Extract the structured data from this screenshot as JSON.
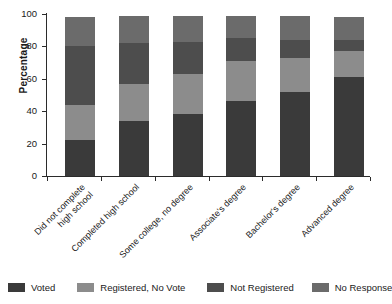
{
  "chart_data": {
    "type": "bar",
    "subtype": "stacked-bar-100",
    "title": "",
    "xlabel": "",
    "ylabel": "Percentage",
    "ylim": [
      0,
      100
    ],
    "yticks": [
      0,
      20,
      40,
      60,
      80,
      100
    ],
    "ytick_labels": [
      "0",
      "20",
      "40",
      "60",
      "80",
      "100"
    ],
    "grid": false,
    "legend_position": "bottom",
    "categories": [
      "Did not complete\nhigh school",
      "Completed high school",
      "Some college, no degree",
      "Associate's degree",
      "Bachelor's degree",
      "Advanced degree"
    ],
    "series": [
      {
        "name": "Voted",
        "color": "#3a3a3a",
        "values": [
          22,
          34,
          38,
          46,
          52,
          61
        ]
      },
      {
        "name": "Registered, No Vote",
        "color": "#8c8c8c",
        "values": [
          22,
          23,
          25,
          25,
          21,
          16
        ]
      },
      {
        "name": "Not Registered",
        "color": "#4d4d4d",
        "values": [
          36,
          25,
          20,
          14,
          11,
          7
        ]
      },
      {
        "name": "No Response",
        "color": "#6b6b6b",
        "values": [
          18,
          17,
          16,
          14,
          15,
          14
        ]
      }
    ],
    "cumulative_tops": [
      [
        22,
        44,
        80,
        98
      ],
      [
        34,
        57,
        82,
        99
      ],
      [
        38,
        63,
        83,
        99
      ],
      [
        46,
        71,
        85,
        99
      ],
      [
        52,
        73,
        84,
        99
      ],
      [
        61,
        77,
        84,
        98
      ]
    ]
  },
  "legend": {
    "items": [
      {
        "label": "Voted",
        "color": "#3a3a3a"
      },
      {
        "label": "Registered, No Vote",
        "color": "#8c8c8c"
      },
      {
        "label": "Not Registered",
        "color": "#4d4d4d"
      },
      {
        "label": "No Response",
        "color": "#6b6b6b"
      }
    ]
  },
  "axis": {
    "y_title": "Percentage"
  }
}
